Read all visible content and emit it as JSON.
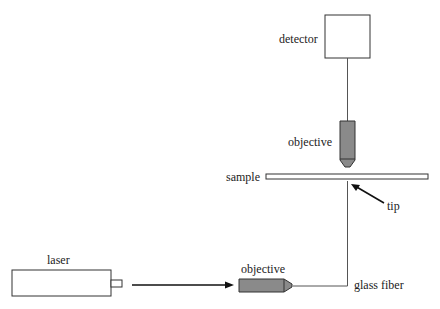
{
  "diagram": {
    "labels": {
      "detector": "detector",
      "objective_top": "objective",
      "sample": "sample",
      "tip": "tip",
      "laser": "laser",
      "objective_bottom": "objective",
      "glass_fiber": "glass fiber"
    },
    "colors": {
      "stroke": "#333333",
      "objective_fill": "#8a8a8a",
      "background": "#ffffff"
    }
  }
}
